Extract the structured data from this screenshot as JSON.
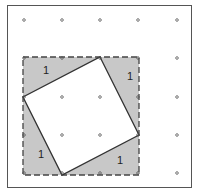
{
  "diagram": {
    "grid": {
      "columns": [
        24,
        62,
        100,
        138,
        177
      ],
      "rows": [
        20,
        58,
        97,
        135,
        173
      ]
    },
    "outer_square": {
      "x1": 23,
      "y1": 57,
      "x2": 139,
      "y2": 175,
      "style": "dashed"
    },
    "inner_square": [
      [
        100,
        57
      ],
      [
        139,
        135
      ],
      [
        62,
        175
      ],
      [
        23,
        97
      ]
    ],
    "triangles": [
      {
        "label": "1",
        "x": 43,
        "y": 74
      },
      {
        "label": "1",
        "x": 127,
        "y": 80
      },
      {
        "label": "1",
        "x": 38,
        "y": 158
      },
      {
        "label": "1",
        "x": 117,
        "y": 164
      }
    ],
    "colors": {
      "shade": "#c8c8c8",
      "line": "#333333",
      "border": "#555555",
      "dot": "#555555"
    }
  }
}
